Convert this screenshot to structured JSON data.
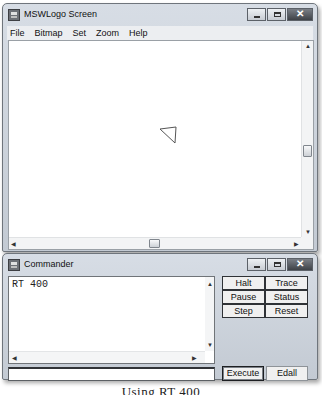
{
  "screen_window": {
    "title": "MSWLogo Screen",
    "menu": [
      "File",
      "Bitmap",
      "Set",
      "Zoom",
      "Help"
    ],
    "controls": {
      "minimize": "minimize-icon",
      "maximize": "maximize-icon",
      "close": "close-icon"
    },
    "close_glyph": "✕",
    "scroll": {
      "up": "▲",
      "down": "▼",
      "left": "◀",
      "right": "▶"
    },
    "turtle": {
      "shape": "triangle",
      "points": "11,4 27,2 26,18",
      "color": "#555555"
    }
  },
  "commander_window": {
    "title": "Commander",
    "close_glyph": "✕",
    "history_text": "RT 400",
    "input_value": "",
    "buttons": [
      "Halt",
      "Trace",
      "Pause",
      "Status",
      "Step",
      "Reset"
    ],
    "execute_label": "Execute",
    "edall_label": "Edall",
    "scroll": {
      "up": "▲",
      "down": "▼",
      "left": "◀",
      "right": "▶"
    }
  },
  "caption": "Using RT 400"
}
